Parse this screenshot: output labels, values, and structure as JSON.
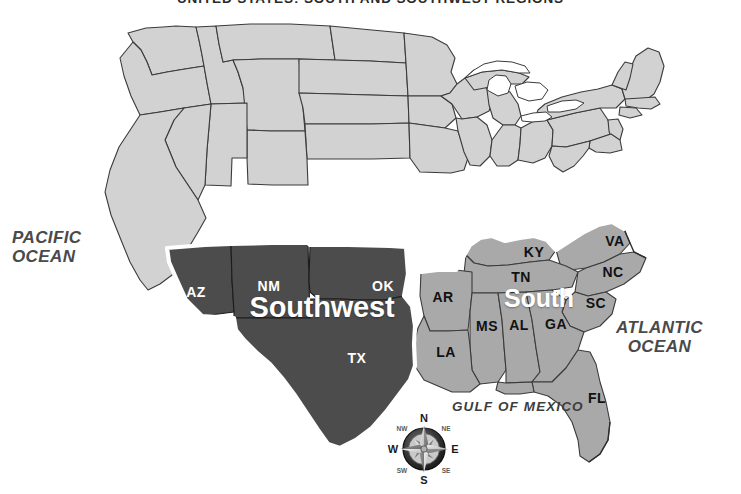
{
  "map": {
    "title": "UNITED STATES: SOUTH AND SOUTHWEST REGIONS",
    "background_color": "#ffffff",
    "colors": {
      "southwest_fill": "#4c4c4c",
      "south_fill": "#a9a9a9",
      "other_states_fill": "#d2d2d2",
      "border_stroke": "#3b3b3b",
      "region_outline": "#ffffff",
      "label_dark": "#111111",
      "label_light": "#ffffff"
    },
    "regions": [
      {
        "id": "southwest",
        "label": "Southwest",
        "fill": "#4c4c4c",
        "label_color": "#ffffff"
      },
      {
        "id": "south",
        "label": "South",
        "fill": "#a9a9a9",
        "label_color": "#ffffff"
      }
    ],
    "water_labels": [
      {
        "id": "pacific",
        "line1": "PACIFIC",
        "line2": "OCEAN"
      },
      {
        "id": "atlantic",
        "line1": "ATLANTIC",
        "line2": "OCEAN"
      },
      {
        "id": "gulf",
        "text": "GULF OF MEXICO"
      }
    ],
    "state_labels": [
      {
        "abbr": "AZ",
        "region": "southwest",
        "on_dark": true
      },
      {
        "abbr": "NM",
        "region": "southwest",
        "on_dark": true
      },
      {
        "abbr": "OK",
        "region": "southwest",
        "on_dark": true
      },
      {
        "abbr": "TX",
        "region": "southwest",
        "on_dark": true
      },
      {
        "abbr": "AR",
        "region": "south",
        "on_dark": false
      },
      {
        "abbr": "LA",
        "region": "south",
        "on_dark": false
      },
      {
        "abbr": "MS",
        "region": "south",
        "on_dark": false
      },
      {
        "abbr": "AL",
        "region": "south",
        "on_dark": false
      },
      {
        "abbr": "GA",
        "region": "south",
        "on_dark": false
      },
      {
        "abbr": "FL",
        "region": "south",
        "on_dark": false
      },
      {
        "abbr": "SC",
        "region": "south",
        "on_dark": false
      },
      {
        "abbr": "NC",
        "region": "south",
        "on_dark": false
      },
      {
        "abbr": "VA",
        "region": "south",
        "on_dark": false
      },
      {
        "abbr": "TN",
        "region": "south",
        "on_dark": false
      },
      {
        "abbr": "KY",
        "region": "south",
        "on_dark": false
      }
    ],
    "compass": {
      "north": "N",
      "south": "S",
      "east": "E",
      "west": "W",
      "northeast": "NE",
      "northwest": "NW",
      "southeast": "SE",
      "southwest": "SW"
    }
  }
}
